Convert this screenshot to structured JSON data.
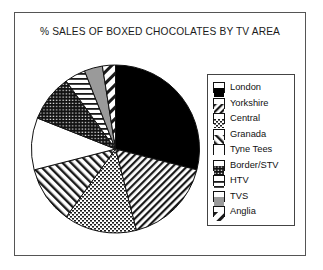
{
  "chart_data": {
    "type": "pie",
    "title": "% SALES OF BOXED CHOCOLATES BY TV AREA",
    "xlabel": "",
    "ylabel": "",
    "legend_position": "right",
    "grid": false,
    "start_angle_deg": 0,
    "direction": "clockwise",
    "categories": [
      "London",
      "Yorkshire",
      "Central",
      "Granada",
      "Tyne Tees",
      "Border/STV",
      "HTV",
      "TVS",
      "Anglia"
    ],
    "values": [
      29,
      17,
      14,
      11,
      10,
      9,
      4,
      3.5,
      2.5
    ],
    "slices": [
      {
        "label": "London",
        "value": 29,
        "start_deg": 0,
        "end_deg": 104.4,
        "pattern": "solid-black",
        "fill": "#000000"
      },
      {
        "label": "Yorkshire",
        "value": 17,
        "start_deg": 104.4,
        "end_deg": 165.6,
        "pattern": "diagonal-hatch",
        "fill": "#ffffff"
      },
      {
        "label": "Central",
        "value": 14,
        "start_deg": 165.6,
        "end_deg": 216.0,
        "pattern": "fine-dots",
        "fill": "#ffffff"
      },
      {
        "label": "Granada",
        "value": 11,
        "start_deg": 216.0,
        "end_deg": 255.6,
        "pattern": "diagonal-stripes",
        "fill": "#ffffff"
      },
      {
        "label": "Tyne Tees",
        "value": 10,
        "start_deg": 255.6,
        "end_deg": 291.6,
        "pattern": "plain-white",
        "fill": "#ffffff"
      },
      {
        "label": "Border/STV",
        "value": 9,
        "start_deg": 291.6,
        "end_deg": 324.0,
        "pattern": "dense-dots",
        "fill": "#ffffff"
      },
      {
        "label": "HTV",
        "value": 4,
        "start_deg": 324.0,
        "end_deg": 338.4,
        "pattern": "horizontal-lines",
        "fill": "#ffffff"
      },
      {
        "label": "TVS",
        "value": 3.5,
        "start_deg": 338.4,
        "end_deg": 351.0,
        "pattern": "solid-gray",
        "fill": "#9a9a9a"
      },
      {
        "label": "Anglia",
        "value": 2.5,
        "start_deg": 351.0,
        "end_deg": 360.0,
        "pattern": "wide-diagonal",
        "fill": "#ffffff"
      }
    ]
  },
  "legend": {
    "items": [
      {
        "label": "London",
        "pattern": "solid-black"
      },
      {
        "label": "Yorkshire",
        "pattern": "diagonal-hatch"
      },
      {
        "label": "Central",
        "pattern": "fine-dots"
      },
      {
        "label": "Granada",
        "pattern": "diagonal-stripes"
      },
      {
        "label": "Tyne Tees",
        "pattern": "plain-white"
      },
      {
        "label": "Border/STV",
        "pattern": "dense-dots"
      },
      {
        "label": "HTV",
        "pattern": "horizontal-lines"
      },
      {
        "label": "TVS",
        "pattern": "solid-gray"
      },
      {
        "label": "Anglia",
        "pattern": "wide-diagonal"
      }
    ]
  },
  "colors": {
    "frame": "#555555",
    "legend_border": "#444444",
    "black": "#000000",
    "gray": "#9a9a9a",
    "white": "#ffffff",
    "text": "#111111"
  }
}
